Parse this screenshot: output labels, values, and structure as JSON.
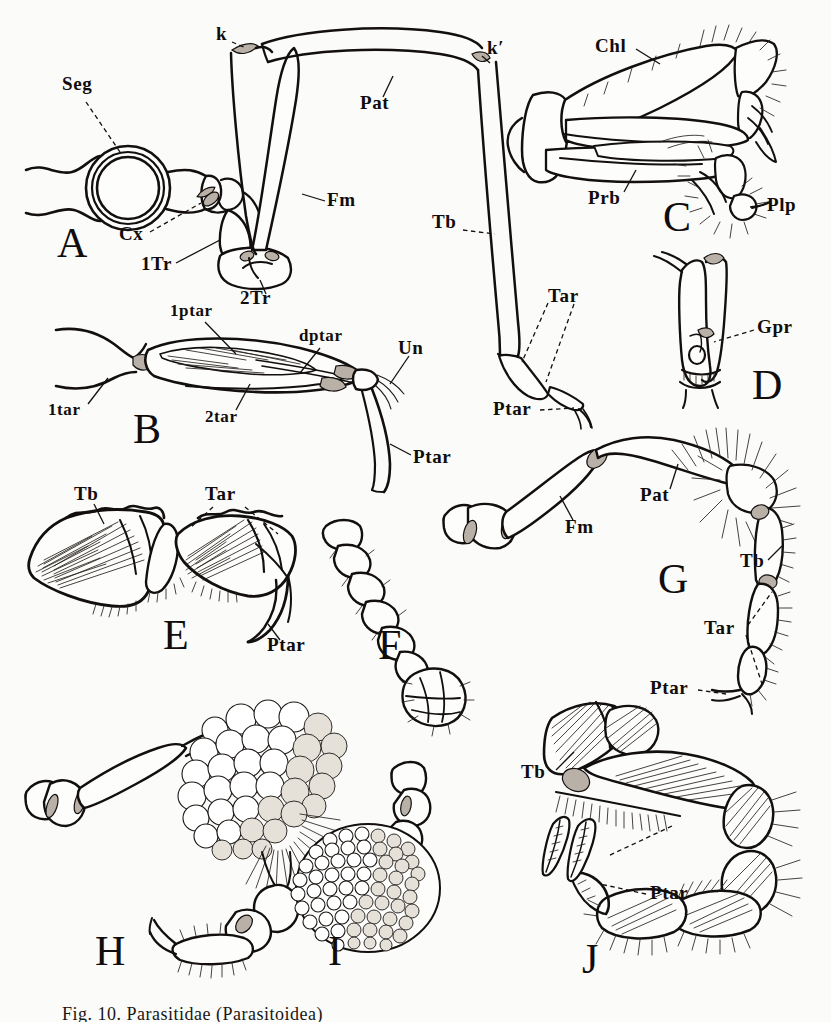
{
  "figure": {
    "caption": "Fig. 10.  Parasitidae  (Parasitoidea)",
    "background_color": "#fbfbf9",
    "ink_color": "#120f0e"
  },
  "panels": [
    {
      "id": "A",
      "letter": "A",
      "title": "leg base in cross-section with body segment"
    },
    {
      "id": "B",
      "letter": "B",
      "title": "tarsus with pretarsus and claws"
    },
    {
      "id": "C",
      "letter": "C",
      "title": "chelicera with palp"
    },
    {
      "id": "D",
      "letter": "D",
      "title": "segment with genital pore"
    },
    {
      "id": "E",
      "letter": "E",
      "title": "tibia and tarsus with pretarsus"
    },
    {
      "id": "F",
      "letter": "F",
      "title": "segmented appendage"
    },
    {
      "id": "G",
      "letter": "G",
      "title": "complete leg with setae"
    },
    {
      "id": "H",
      "letter": "H",
      "title": "leg bearing clustered egg mass"
    },
    {
      "id": "I",
      "letter": "I",
      "title": "dense granular egg mass"
    },
    {
      "id": "J",
      "letter": "J",
      "title": "leg with plumose setae and detached setae"
    }
  ],
  "labels": [
    {
      "id": "seg",
      "text": "Seg",
      "panel": "A",
      "x": 62,
      "y": 84,
      "leader": "dashed"
    },
    {
      "id": "cx",
      "text": "Cx",
      "panel": "A",
      "x": 119,
      "y": 234,
      "leader": "dashed"
    },
    {
      "id": "1tr",
      "text": "1Tr",
      "panel": "A",
      "x": 141,
      "y": 264,
      "leader": "solid"
    },
    {
      "id": "2tr",
      "text": "2Tr",
      "panel": "A",
      "x": 240,
      "y": 298,
      "leader": "solid"
    },
    {
      "id": "k",
      "text": "k",
      "panel": "A",
      "x": 216,
      "y": 34,
      "leader": "dashed"
    },
    {
      "id": "kprime",
      "text": "k′",
      "panel": "A",
      "x": 487,
      "y": 48,
      "leader": "solid"
    },
    {
      "id": "pat_a",
      "text": "Pat",
      "panel": "A",
      "x": 360,
      "y": 103,
      "leader": "solid"
    },
    {
      "id": "fm_a",
      "text": "Fm",
      "panel": "A",
      "x": 327,
      "y": 200,
      "leader": "solid"
    },
    {
      "id": "tb_a",
      "text": "Tb",
      "panel": "A",
      "x": 432,
      "y": 222,
      "leader": "dashed"
    },
    {
      "id": "tar_a",
      "text": "Tar",
      "panel": "A",
      "x": 548,
      "y": 296,
      "leader": "dashed"
    },
    {
      "id": "ptar_a",
      "text": "Ptar",
      "panel": "A",
      "x": 493,
      "y": 409,
      "leader": "dashed"
    },
    {
      "id": "1ptar",
      "text": "1ptar",
      "panel": "B",
      "x": 170,
      "y": 312,
      "leader": "solid"
    },
    {
      "id": "dptar",
      "text": "dptar",
      "panel": "B",
      "x": 299,
      "y": 337,
      "leader": "solid"
    },
    {
      "id": "un",
      "text": "Un",
      "panel": "B",
      "x": 398,
      "y": 348,
      "leader": "solid"
    },
    {
      "id": "1tar",
      "text": "1tar",
      "panel": "B",
      "x": 48,
      "y": 411,
      "leader": "solid"
    },
    {
      "id": "2tar",
      "text": "2tar",
      "panel": "B",
      "x": 205,
      "y": 418,
      "leader": "solid"
    },
    {
      "id": "ptar_b",
      "text": "Ptar",
      "panel": "B",
      "x": 413,
      "y": 457,
      "leader": "solid"
    },
    {
      "id": "chl",
      "text": "Chl",
      "panel": "C",
      "x": 595,
      "y": 46,
      "leader": "solid"
    },
    {
      "id": "prb",
      "text": "Prb",
      "panel": "C",
      "x": 588,
      "y": 198,
      "leader": "solid"
    },
    {
      "id": "plp",
      "text": "Plp",
      "panel": "C",
      "x": 767,
      "y": 205,
      "leader": "solid"
    },
    {
      "id": "gpr",
      "text": "Gpr",
      "panel": "D",
      "x": 757,
      "y": 327,
      "leader": "dashed"
    },
    {
      "id": "tb_e",
      "text": "Tb",
      "panel": "E",
      "x": 74,
      "y": 494,
      "leader": "solid"
    },
    {
      "id": "tar_e",
      "text": "Tar",
      "panel": "E",
      "x": 205,
      "y": 494,
      "leader": "dashed"
    },
    {
      "id": "ptar_e",
      "text": "Ptar",
      "panel": "E",
      "x": 267,
      "y": 645,
      "leader": "solid"
    },
    {
      "id": "pat_g",
      "text": "Pat",
      "panel": "G",
      "x": 640,
      "y": 495,
      "leader": "solid"
    },
    {
      "id": "fm_g",
      "text": "Fm",
      "panel": "G",
      "x": 565,
      "y": 527,
      "leader": "solid"
    },
    {
      "id": "tb_g",
      "text": "Tb",
      "panel": "G",
      "x": 740,
      "y": 561,
      "leader": "solid"
    },
    {
      "id": "tar_g",
      "text": "Tar",
      "panel": "G",
      "x": 704,
      "y": 628,
      "leader": "dashed"
    },
    {
      "id": "ptar_g",
      "text": "Ptar",
      "panel": "G",
      "x": 650,
      "y": 688,
      "leader": "dashed"
    },
    {
      "id": "tb_j",
      "text": "Tb",
      "panel": "J",
      "x": 521,
      "y": 772,
      "leader": "solid"
    },
    {
      "id": "ptar_j",
      "text": "Ptar",
      "panel": "J",
      "x": 650,
      "y": 893,
      "leader": "solid"
    }
  ],
  "panel_letters": [
    {
      "letter": "A",
      "x": 57,
      "y": 222
    },
    {
      "letter": "B",
      "x": 133,
      "y": 408
    },
    {
      "letter": "C",
      "x": 663,
      "y": 196
    },
    {
      "letter": "D",
      "x": 752,
      "y": 364
    },
    {
      "letter": "E",
      "x": 163,
      "y": 614
    },
    {
      "letter": "F",
      "x": 378,
      "y": 624
    },
    {
      "letter": "G",
      "x": 658,
      "y": 558
    },
    {
      "letter": "H",
      "x": 95,
      "y": 930
    },
    {
      "letter": "I",
      "x": 328,
      "y": 930
    },
    {
      "letter": "J",
      "x": 582,
      "y": 938
    }
  ]
}
